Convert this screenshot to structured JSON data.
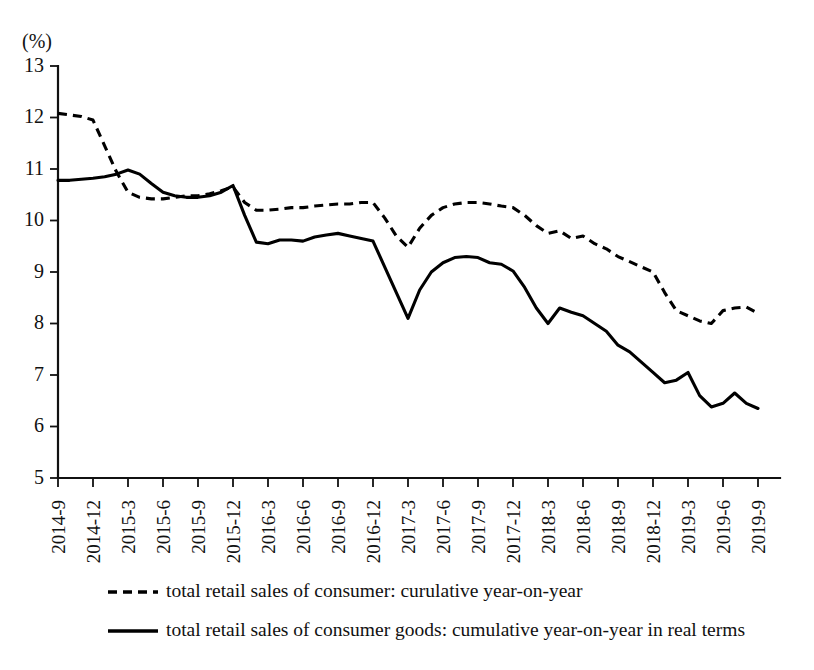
{
  "chart_data": {
    "type": "line",
    "title": "",
    "xlabel": "",
    "ylabel": "(%)",
    "ylim": [
      5,
      13
    ],
    "ytick_values": [
      5,
      6,
      7,
      8,
      9,
      10,
      11,
      12,
      13
    ],
    "ytick_labels": [
      "5",
      "6",
      "7",
      "8",
      "9",
      "10",
      "11",
      "12",
      "13"
    ],
    "grid": false,
    "legend_position": "bottom",
    "x": [
      "2014-9",
      "2014-10",
      "2014-11",
      "2014-12",
      "2015-1",
      "2015-2",
      "2015-3",
      "2015-4",
      "2015-5",
      "2015-6",
      "2015-7",
      "2015-8",
      "2015-9",
      "2015-10",
      "2015-11",
      "2015-12",
      "2016-1",
      "2016-2",
      "2016-3",
      "2016-4",
      "2016-5",
      "2016-6",
      "2016-7",
      "2016-8",
      "2016-9",
      "2016-10",
      "2016-11",
      "2016-12",
      "2017-1",
      "2017-2",
      "2017-3",
      "2017-4",
      "2017-5",
      "2017-6",
      "2017-7",
      "2017-8",
      "2017-9",
      "2017-10",
      "2017-11",
      "2017-12",
      "2018-1",
      "2018-2",
      "2018-3",
      "2018-4",
      "2018-5",
      "2018-6",
      "2018-7",
      "2018-8",
      "2018-9",
      "2018-10",
      "2018-11",
      "2018-12",
      "2019-1",
      "2019-2",
      "2019-3",
      "2019-4",
      "2019-5",
      "2019-6",
      "2019-7",
      "2019-8",
      "2019-9"
    ],
    "xtick_labels": [
      "2014-9",
      "2014-12",
      "2015-3",
      "2015-6",
      "2015-9",
      "2015-12",
      "2016-3",
      "2016-6",
      "2016-9",
      "2016-12",
      "2017-3",
      "2017-6",
      "2017-9",
      "2017-12",
      "2018-3",
      "2018-6",
      "2018-9",
      "2018-12",
      "2019-3",
      "2019-6",
      "2019-9"
    ],
    "xtick_indices": [
      0,
      3,
      6,
      9,
      12,
      15,
      18,
      21,
      24,
      27,
      30,
      33,
      36,
      39,
      42,
      45,
      48,
      51,
      54,
      57,
      60
    ],
    "series": [
      {
        "name": "total retail sales of consumer: curulative year-on-year",
        "style": "dashed",
        "color": "#000000",
        "values": [
          12.08,
          12.05,
          12.02,
          11.95,
          11.45,
          10.95,
          10.55,
          10.45,
          10.42,
          10.42,
          10.45,
          10.48,
          10.48,
          10.52,
          10.58,
          10.65,
          10.35,
          10.2,
          10.2,
          10.22,
          10.25,
          10.25,
          10.28,
          10.3,
          10.32,
          10.32,
          10.35,
          10.35,
          10.05,
          9.7,
          9.48,
          9.85,
          10.1,
          10.25,
          10.32,
          10.35,
          10.35,
          10.32,
          10.28,
          10.25,
          10.1,
          9.9,
          9.75,
          9.8,
          9.65,
          9.7,
          9.55,
          9.45,
          9.3,
          9.2,
          9.1,
          9.0,
          8.6,
          8.25,
          8.15,
          8.05,
          8.0,
          8.25,
          8.3,
          8.32,
          8.2
        ]
      },
      {
        "name": "total retail sales of consumer goods: cumulative year-on-year in real terms",
        "style": "solid",
        "color": "#000000",
        "values": [
          10.78,
          10.78,
          10.8,
          10.82,
          10.85,
          10.9,
          10.98,
          10.9,
          10.72,
          10.55,
          10.48,
          10.45,
          10.45,
          10.48,
          10.55,
          10.68,
          10.1,
          9.58,
          9.55,
          9.62,
          9.62,
          9.6,
          9.68,
          9.72,
          9.75,
          9.7,
          9.65,
          9.6,
          9.1,
          8.6,
          8.1,
          8.65,
          9.0,
          9.18,
          9.28,
          9.3,
          9.28,
          9.18,
          9.15,
          9.02,
          8.7,
          8.3,
          8.0,
          8.3,
          8.22,
          8.15,
          8.0,
          7.85,
          7.58,
          7.45,
          7.25,
          7.05,
          6.85,
          6.9,
          7.05,
          6.6,
          6.38,
          6.45,
          6.65,
          6.45,
          6.35
        ]
      }
    ]
  },
  "legend": {
    "items": [
      {
        "label": "total retail sales of consumer: curulative year-on-year",
        "style": "dashed"
      },
      {
        "label": "total retail sales of consumer goods: cumulative year-on-year in real terms",
        "style": "solid"
      }
    ]
  }
}
